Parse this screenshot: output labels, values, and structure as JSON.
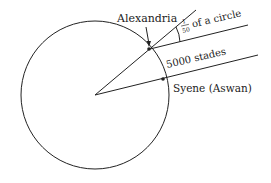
{
  "diagram": {
    "labels": {
      "alexandria": "Alexandria",
      "fraction_num": "1",
      "fraction_den": "50",
      "fraction_text": "of a circle",
      "distance": "5000 stades",
      "syene": "Syene (Aswan)"
    },
    "colors": {
      "stroke": "#222222",
      "background": "#ffffff"
    }
  }
}
